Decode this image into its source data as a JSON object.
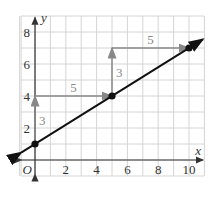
{
  "chart_data": {
    "type": "line",
    "title": "",
    "xlabel": "x",
    "ylabel": "y",
    "origin_label": "O",
    "xlim": [
      -1,
      11
    ],
    "ylim": [
      -1,
      9
    ],
    "grid": true,
    "x_ticks": [
      2,
      4,
      6,
      8,
      10
    ],
    "y_ticks": [
      2,
      4,
      6,
      8
    ],
    "x_tick_labels": [
      "2",
      "4",
      "6",
      "8",
      "10"
    ],
    "y_tick_labels": [
      "2",
      "4",
      "6",
      "8"
    ],
    "series": [
      {
        "name": "line",
        "x": [
          0,
          5,
          10
        ],
        "y": [
          1,
          4,
          7
        ],
        "slope": 0.6,
        "intercept": 1
      }
    ],
    "points": [
      {
        "x": 0,
        "y": 1
      },
      {
        "x": 5,
        "y": 4
      },
      {
        "x": 10,
        "y": 7
      }
    ],
    "annotations": [
      {
        "type": "rise",
        "from": [
          0,
          1
        ],
        "to": [
          0,
          4
        ],
        "label": "3"
      },
      {
        "type": "run",
        "from": [
          0,
          4
        ],
        "to": [
          5,
          4
        ],
        "label": "5"
      },
      {
        "type": "rise",
        "from": [
          5,
          4
        ],
        "to": [
          5,
          7
        ],
        "label": "3"
      },
      {
        "type": "run",
        "from": [
          5,
          7
        ],
        "to": [
          10,
          7
        ],
        "label": "5"
      }
    ],
    "colors": {
      "line": "#111111",
      "annotation": "#888888",
      "grid": "#d4d4d4",
      "axis": "#333333"
    }
  }
}
